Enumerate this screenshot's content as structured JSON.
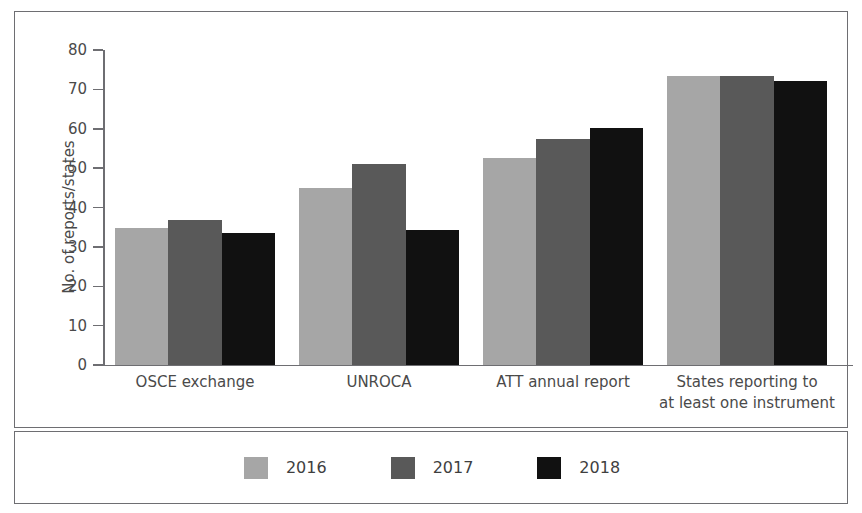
{
  "chart_data": {
    "type": "bar",
    "title": "",
    "xlabel": "",
    "ylabel": "No. of reports/states",
    "ylim": [
      0,
      80
    ],
    "ytick_values": [
      0,
      10,
      20,
      30,
      40,
      50,
      60,
      70,
      80
    ],
    "ytick_labels": [
      "0",
      "10",
      "20",
      "30",
      "40",
      "50",
      "60",
      "70",
      "80"
    ],
    "grid": false,
    "legend_position": "bottom",
    "categories": [
      "OSCE exchange",
      "UNROCA",
      "ATT annual report",
      "States reporting to\nat least one instrument"
    ],
    "category_lines": [
      [
        "OSCE exchange"
      ],
      [
        "UNROCA"
      ],
      [
        "ATT annual report"
      ],
      [
        "States reporting to",
        "at least one instrument"
      ]
    ],
    "series": [
      {
        "name": "2016",
        "color": "#a6a6a6",
        "values": [
          34.8,
          45.0,
          52.5,
          73.3
        ]
      },
      {
        "name": "2017",
        "color": "#595959",
        "values": [
          36.8,
          51.0,
          57.5,
          73.3
        ]
      },
      {
        "name": "2018",
        "color": "#111111",
        "values": [
          33.5,
          34.2,
          60.2,
          72.1
        ]
      }
    ]
  },
  "legend": {
    "entries": [
      {
        "label": "2016",
        "color": "#a6a6a6"
      },
      {
        "label": "2017",
        "color": "#595959"
      },
      {
        "label": "2018",
        "color": "#111111"
      }
    ]
  },
  "colors": {
    "border": "#6e6e72",
    "text": "#4a4a4a",
    "background": "#ffffff"
  }
}
